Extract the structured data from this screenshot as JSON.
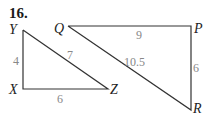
{
  "problem_number": "16.",
  "triangle_xyz": {
    "vertices": {
      "Y": "Y",
      "X": "X",
      "Z": "Z"
    },
    "sides": {
      "XY": "4",
      "YZ": "7",
      "XZ": "6"
    }
  },
  "triangle_qpr": {
    "vertices": {
      "Q": "Q",
      "P": "P",
      "R": "R"
    },
    "sides": {
      "QP": "9",
      "QR": "10.5",
      "PR": "6"
    }
  },
  "colors": {
    "edge": "#333333",
    "side_label": "#888888",
    "vertex_label": "#222222"
  }
}
